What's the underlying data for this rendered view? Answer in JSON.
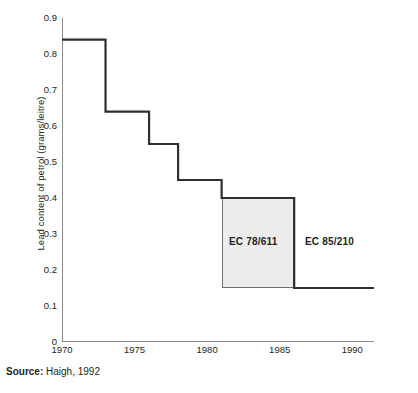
{
  "figure": {
    "y_axis_title": "Lead content of petrol (grams/leitre)",
    "source_label": "Source:",
    "source_text": "Haigh, 1992",
    "annotations": {
      "ec_78_611": "EC 78/611",
      "ec_85_210": "EC 85/210"
    },
    "colors": {
      "line": "#2f2f2f",
      "axis": "#8a8a8a",
      "shaded_fill": "#ececec",
      "shaded_stroke": "#6e6e6e",
      "text": "#231f20"
    }
  },
  "chart_data": {
    "type": "line",
    "title": "",
    "subtitle": "",
    "xlabel": "",
    "ylabel": "Lead content of petrol (grams/leitre)",
    "xlim": [
      1970,
      1991.5
    ],
    "ylim": [
      0,
      0.9
    ],
    "grid": false,
    "legend": "none",
    "step_style": "post",
    "xticks": [
      1970,
      1975,
      1980,
      1985,
      1990
    ],
    "xtick_labels": [
      "1970",
      "1975",
      "1980",
      "1985",
      "1990"
    ],
    "yticks": [
      0,
      0.1,
      0.2,
      0.3,
      0.4,
      0.5,
      0.6,
      0.7,
      0.8,
      0.9
    ],
    "ytick_labels": [
      "0",
      "0.1",
      "0.2",
      "0.3",
      "0.4",
      "0.5",
      "0.6",
      "0.7",
      "0.8",
      "0.9"
    ],
    "series": [
      {
        "name": "Lead content of petrol",
        "x": [
          1970,
          1973,
          1976,
          1978,
          1981,
          1986,
          1991.5
        ],
        "values": [
          0.84,
          0.64,
          0.55,
          0.45,
          0.4,
          0.15,
          0.15
        ]
      }
    ],
    "annotations": [
      {
        "text": "EC 78/611",
        "x": 1983.5,
        "y": 0.275,
        "kind": "shaded-region-label"
      },
      {
        "text": "EC 85/210",
        "x": 1988.0,
        "y": 0.275,
        "kind": "region-label"
      }
    ],
    "shaded_regions": [
      {
        "label": "EC 78/611",
        "x_start": 1981,
        "x_end": 1986,
        "y_bottom": 0.15,
        "y_top": 0.4
      }
    ]
  }
}
